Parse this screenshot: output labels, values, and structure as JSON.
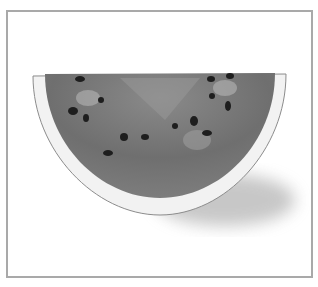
{
  "image": {
    "subject": "watermelon slice",
    "style": "grayscale photograph",
    "frame_color": "#a9a9a9",
    "background_color": "#ffffff"
  }
}
